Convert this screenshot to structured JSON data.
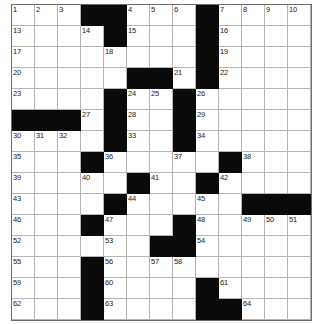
{
  "puzzle": {
    "title": "Crossword Grid",
    "rows": 15,
    "cols": 13,
    "colors": {
      "block": "#0a0a0a",
      "cell": "#ffffff",
      "gridline": "#b4b4b4",
      "border": "#6e6e6e",
      "number": "#1a1a1a"
    },
    "blocks": [
      [
        1,
        4
      ],
      [
        1,
        5
      ],
      [
        1,
        9
      ],
      [
        2,
        5
      ],
      [
        2,
        9
      ],
      [
        3,
        9
      ],
      [
        4,
        6
      ],
      [
        4,
        7
      ],
      [
        4,
        9
      ],
      [
        5,
        5
      ],
      [
        5,
        8
      ],
      [
        6,
        1
      ],
      [
        6,
        2
      ],
      [
        6,
        3
      ],
      [
        6,
        5
      ],
      [
        6,
        8
      ],
      [
        7,
        5
      ],
      [
        7,
        8
      ],
      [
        8,
        4
      ],
      [
        8,
        10
      ],
      [
        9,
        6
      ],
      [
        9,
        9
      ],
      [
        10,
        5
      ],
      [
        10,
        11
      ],
      [
        10,
        12
      ],
      [
        10,
        13
      ],
      [
        11,
        4
      ],
      [
        11,
        8
      ],
      [
        12,
        7
      ],
      [
        12,
        8
      ],
      [
        13,
        4
      ],
      [
        14,
        4
      ],
      [
        14,
        9
      ],
      [
        15,
        4
      ],
      [
        15,
        9
      ],
      [
        15,
        10
      ]
    ],
    "numbers": {
      "1-1": "1",
      "1-2": "2",
      "1-3": "3",
      "1-6": "4",
      "1-7": "5",
      "1-8": "6",
      "1-10": "10",
      "1-11": "11",
      "1-12": "12",
      "2-1": "13",
      "2-4": "14",
      "2-6": "15",
      "2-10": "16",
      "3-1": "17",
      "3-5": "18",
      "3-10": "19",
      "4-1": "20",
      "4-8": "21",
      "4-10": "22",
      "5-1": "23",
      "5-6": "24",
      "5-7": "25",
      "5-9": "26",
      "6-4": "27",
      "6-6": "28",
      "6-9": "29",
      "7-1": "30",
      "7-2": "31",
      "7-3": "32",
      "7-6": "33",
      "7-9": "34",
      "8-1": "35",
      "8-5": "36",
      "8-8": "37",
      "8-11": "38",
      "9-1": "39",
      "9-4": "40",
      "9-7": "41",
      "9-10": "42",
      "10-1": "43",
      "10-6": "44",
      "10-9": "45",
      "11-1": "46",
      "11-5": "47",
      "11-9": "48",
      "11-11": "49",
      "11-12": "50",
      "11-13": "51",
      "12-1": "52",
      "12-5": "53",
      "12-9": "54",
      "13-1": "55",
      "13-5": "56",
      "13-7": "57",
      "13-8": "58",
      "14-1": "59",
      "14-5": "60",
      "14-10": "61",
      "15-1": "62",
      "15-5": "63",
      "15-11": "64"
    },
    "row1_extra_numbers": {
      "note": "row 1 col 9 is a block; numbers 7,8,9 sit in row1 cols 8,9 region"
    },
    "numbers_overrides": {
      "1-8": "6",
      "1-9_skip": true
    },
    "row1_sequence": [
      "1",
      "2",
      "3",
      "",
      "",
      "4",
      "5",
      "6",
      "7",
      "8",
      "9",
      "10",
      "11",
      "12"
    ],
    "letters": {}
  }
}
